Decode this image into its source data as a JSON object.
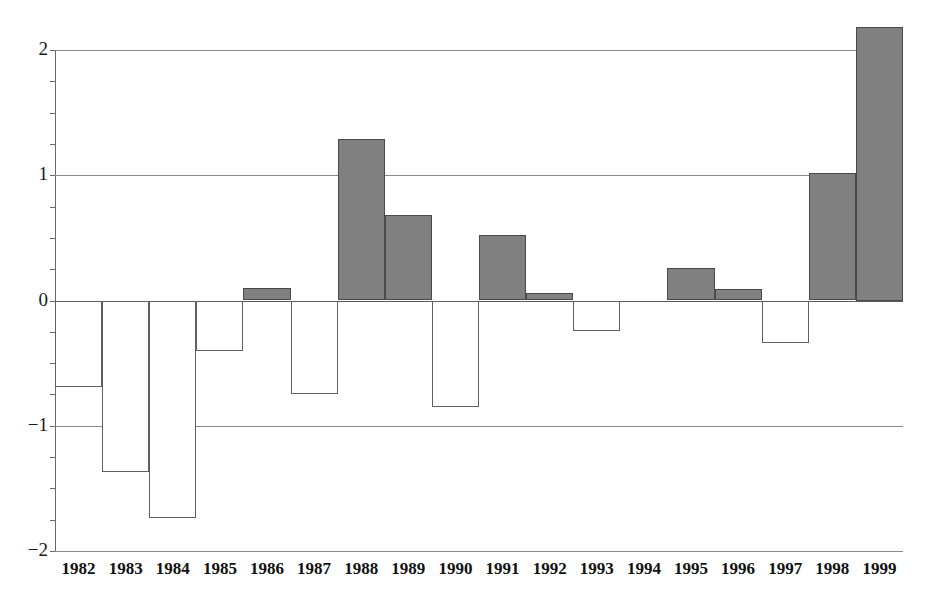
{
  "chart_data": {
    "type": "bar",
    "title": "",
    "subtitle": "",
    "xlabel": "",
    "ylabel": "",
    "categories": [
      "1982",
      "1983",
      "1984",
      "1985",
      "1986",
      "1987",
      "1988",
      "1989",
      "1990",
      "1991",
      "1992",
      "1993",
      "1994",
      "1995",
      "1996",
      "1997",
      "1998",
      "1999"
    ],
    "values": [
      -0.69,
      -1.37,
      -1.74,
      -0.4,
      0.1,
      -0.75,
      1.29,
      0.68,
      -0.85,
      0.52,
      0.06,
      -0.24,
      0.0,
      0.26,
      0.09,
      -0.34,
      1.02,
      2.18
    ],
    "series": [
      {
        "name": "value",
        "values": [
          -0.69,
          -1.37,
          -1.74,
          -0.4,
          0.1,
          -0.75,
          1.29,
          0.68,
          -0.85,
          0.52,
          0.06,
          -0.24,
          0.0,
          0.26,
          0.09,
          -0.34,
          1.02,
          2.18
        ]
      }
    ],
    "ylim": [
      -2,
      2
    ],
    "ytick_labels": [
      "2",
      "1",
      "0",
      "−1",
      "−2"
    ],
    "ytick_values": [
      2,
      1,
      0,
      -1,
      -2
    ],
    "minor_tick_values": [
      1.75,
      1.5,
      1.25,
      0.75,
      0.5,
      0.25,
      -0.25,
      -0.5,
      -0.75,
      -1.25,
      -1.5,
      -1.75
    ],
    "grid": true,
    "grid_axis": "y",
    "legend": null,
    "legend_position": "none",
    "annotations": [],
    "bar_fill_positive": "#808080",
    "bar_fill_negative": "#ffffff",
    "bar_stroke": "#5a5a5a",
    "axis_color": "#6a6a6a",
    "background": "#ffffff"
  }
}
